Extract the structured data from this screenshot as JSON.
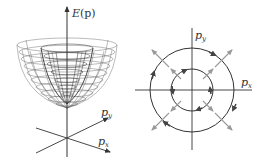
{
  "left_panel": {
    "title": "energy-dispersion-paraboloid",
    "vertical_axis_label": {
      "main": "E",
      "arg": "(p)"
    },
    "axis_x_label": {
      "main": "p",
      "sub": "x"
    },
    "axis_y_label": {
      "main": "p",
      "sub": "y"
    },
    "surfaces": [
      "outer-paraboloid-mesh",
      "inner-paraboloid-mesh"
    ]
  },
  "right_panel": {
    "title": "fermi-contours-with-spin-arrows",
    "axis_x_label": {
      "main": "p",
      "sub": "x"
    },
    "axis_y_label": {
      "main": "p",
      "sub": "y"
    },
    "circles": [
      {
        "name": "outer",
        "radius": 42
      },
      {
        "name": "inner",
        "radius": 21
      }
    ],
    "radial_arrow_directions_deg": [
      45,
      135,
      225,
      315
    ]
  },
  "colors": {
    "line": "#333333",
    "mesh": "#555555",
    "radial_arrow": "#9a9a9a",
    "tangent_arrow": "#444444",
    "background": "#ffffff"
  }
}
